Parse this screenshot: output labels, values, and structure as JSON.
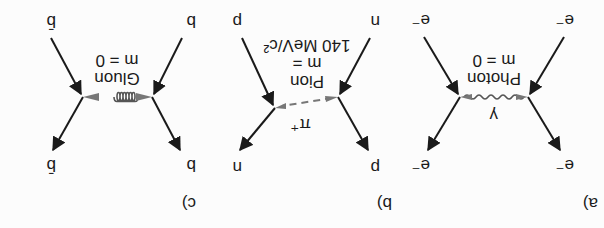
{
  "figure": {
    "orientation": "rotated 180 degrees",
    "panels": [
      {
        "id": "a",
        "label": "a)",
        "incoming_left": "e⁻",
        "incoming_right": "e⁻",
        "outgoing_left": "e⁻",
        "outgoing_right": "e⁻",
        "mediator_symbol": "γ",
        "mediator_name": "Photon",
        "mediator_mass": "m = 0",
        "line_style": "wavy"
      },
      {
        "id": "b",
        "label": "b)",
        "incoming_left": "n",
        "incoming_right": "p",
        "outgoing_left": "p",
        "outgoing_right": "n",
        "mediator_symbol": "π⁺",
        "mediator_name": "Pion",
        "mediator_mass_line1": "m =",
        "mediator_mass_line2": "140 MeV/c²",
        "line_style": "dashed"
      },
      {
        "id": "c",
        "label": "c)",
        "incoming_left": "b",
        "incoming_right": "b̄",
        "outgoing_left": "b",
        "outgoing_right": "b̄",
        "mediator_name": "Gluon",
        "mediator_mass": "m = 0",
        "line_style": "coil"
      }
    ]
  }
}
